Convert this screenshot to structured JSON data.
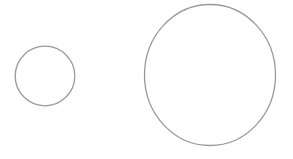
{
  "canvas": {
    "width": 293,
    "height": 159,
    "background": "#ffffff"
  },
  "shapes": {
    "small_circle": {
      "type": "ellipse",
      "cx": 45,
      "cy": 76,
      "rx": 29.8,
      "ry": 29.8,
      "fill": "none",
      "stroke": "#999999",
      "stroke_width": 1.3
    },
    "large_circle": {
      "type": "ellipse",
      "cx": 210,
      "cy": 75,
      "rx": 65.5,
      "ry": 70.5,
      "fill": "none",
      "stroke": "#999999",
      "stroke_width": 1.3
    }
  }
}
